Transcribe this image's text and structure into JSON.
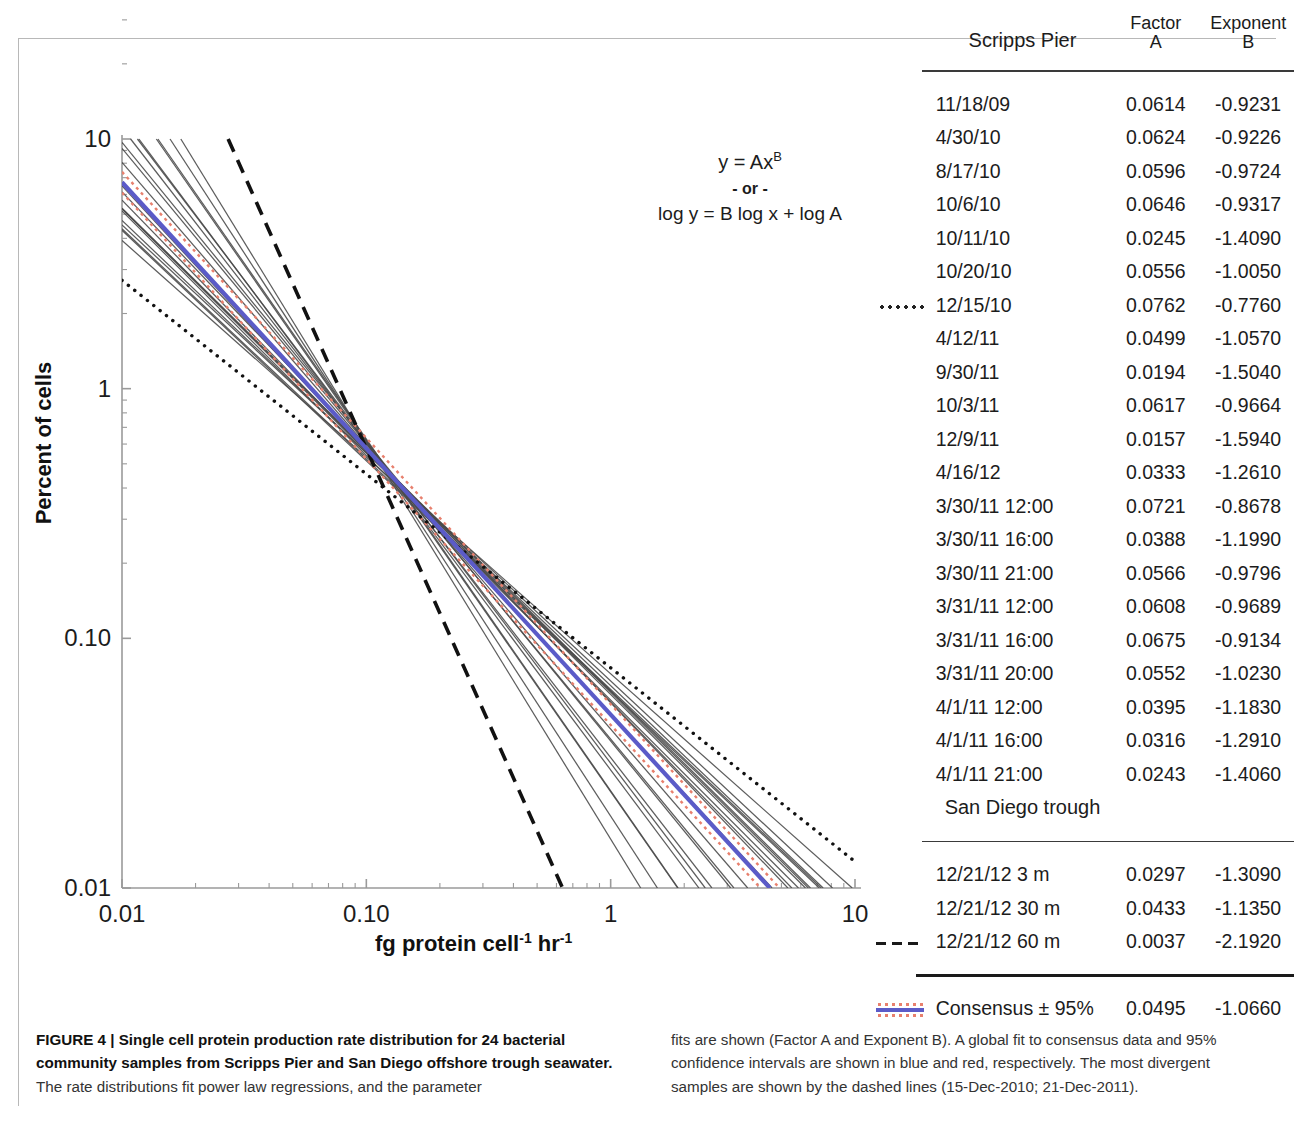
{
  "figure": {
    "equation": {
      "line1_prefix": "y = Ax",
      "line1_exponent": "B",
      "line2": "- or -",
      "line3": "log y = B log x + log A"
    },
    "axes": {
      "ylabel": "Percent of cells",
      "xlabel_prefix": "fg protein cell",
      "xlabel_sup1": "-1",
      "xlabel_mid": " hr",
      "xlabel_sup2": "-1",
      "x_ticks": [
        "0.01",
        "0.10",
        "1",
        "10"
      ],
      "y_ticks": [
        "10",
        "1",
        "0.10",
        "0.01"
      ]
    }
  },
  "table": {
    "headers": {
      "group": "Scripps Pier",
      "factor_line1": "Factor",
      "factor_line2": "A",
      "exponent_line1": "Exponent",
      "exponent_line2": "B"
    },
    "subheader": "San Diego trough",
    "scripps_rows": [
      {
        "name": "11/18/09",
        "a": "0.0614",
        "b": "-0.9231",
        "mark": ""
      },
      {
        "name": "4/30/10",
        "a": "0.0624",
        "b": "-0.9226",
        "mark": ""
      },
      {
        "name": "8/17/10",
        "a": "0.0596",
        "b": "-0.9724",
        "mark": ""
      },
      {
        "name": "10/6/10",
        "a": "0.0646",
        "b": "-0.9317",
        "mark": ""
      },
      {
        "name": "10/11/10",
        "a": "0.0245",
        "b": "-1.4090",
        "mark": ""
      },
      {
        "name": "10/20/10",
        "a": "0.0556",
        "b": "-1.0050",
        "mark": ""
      },
      {
        "name": "12/15/10",
        "a": "0.0762",
        "b": "-0.7760",
        "mark": "dotted-line"
      },
      {
        "name": "4/12/11",
        "a": "0.0499",
        "b": "-1.0570",
        "mark": ""
      },
      {
        "name": "9/30/11",
        "a": "0.0194",
        "b": "-1.5040",
        "mark": ""
      },
      {
        "name": "10/3/11",
        "a": "0.0617",
        "b": "-0.9664",
        "mark": ""
      },
      {
        "name": "12/9/11",
        "a": "0.0157",
        "b": "-1.5940",
        "mark": ""
      },
      {
        "name": "4/16/12",
        "a": "0.0333",
        "b": "-1.2610",
        "mark": ""
      },
      {
        "name": "3/30/11 12:00",
        "a": "0.0721",
        "b": "-0.8678",
        "mark": ""
      },
      {
        "name": "3/30/11 16:00",
        "a": "0.0388",
        "b": "-1.1990",
        "mark": ""
      },
      {
        "name": "3/30/11 21:00",
        "a": "0.0566",
        "b": "-0.9796",
        "mark": ""
      },
      {
        "name": "3/31/11 12:00",
        "a": "0.0608",
        "b": "-0.9689",
        "mark": ""
      },
      {
        "name": "3/31/11 16:00",
        "a": "0.0675",
        "b": "-0.9134",
        "mark": ""
      },
      {
        "name": "3/31/11 20:00",
        "a": "0.0552",
        "b": "-1.0230",
        "mark": ""
      },
      {
        "name": "4/1/11 12:00",
        "a": "0.0395",
        "b": "-1.1830",
        "mark": ""
      },
      {
        "name": "4/1/11 16:00",
        "a": "0.0316",
        "b": "-1.2910",
        "mark": ""
      },
      {
        "name": "4/1/11 21:00",
        "a": "0.0243",
        "b": "-1.4060",
        "mark": ""
      }
    ],
    "trough_rows": [
      {
        "name": "12/21/12 3 m",
        "a": "0.0297",
        "b": "-1.3090",
        "mark": ""
      },
      {
        "name": "12/21/12 30 m",
        "a": "0.0433",
        "b": "-1.1350",
        "mark": ""
      },
      {
        "name": "12/21/12 60 m",
        "a": "0.0037",
        "b": "-2.1920",
        "mark": "dashed-line"
      }
    ],
    "consensus_row": {
      "name": "Consensus ± 95%",
      "a": "0.0495",
      "b": "-1.0660",
      "mark": "consensus-line"
    }
  },
  "caption": {
    "left": "FIGURE 4 | Single cell protein production rate distribution for 24 bacterial community samples from Scripps Pier and San Diego offshore trough seawater.",
    "left_rest": " The rate distributions fit power law regressions, and the parameter",
    "right": "fits are shown (Factor A and Exponent B). A global fit to consensus data and 95% confidence intervals are shown in blue and red, respectively. The most divergent samples are shown by the dashed lines (15-Dec-2010; 21-Dec-2011)."
  },
  "colors": {
    "consensus_blue": "#5b5bc8",
    "ci_red": "#e8806e",
    "line_gray": "#4a4a4a",
    "axis": "#9a9a9a"
  },
  "chart_data": {
    "type": "line",
    "title": "",
    "xlabel": "fg protein cell-1 hr-1",
    "ylabel": "Percent of cells",
    "xlim": [
      0.01,
      10
    ],
    "ylim": [
      0.01,
      10
    ],
    "xscale": "log",
    "yscale": "log",
    "grid": false,
    "legend": "table-at-right",
    "model": "y = A*x^B",
    "series": [
      {
        "name": "11/18/09",
        "A": 0.0614,
        "B": -0.9231,
        "style": "solid-gray"
      },
      {
        "name": "4/30/10",
        "A": 0.0624,
        "B": -0.9226,
        "style": "solid-gray"
      },
      {
        "name": "8/17/10",
        "A": 0.0596,
        "B": -0.9724,
        "style": "solid-gray"
      },
      {
        "name": "10/6/10",
        "A": 0.0646,
        "B": -0.9317,
        "style": "solid-gray"
      },
      {
        "name": "10/11/10",
        "A": 0.0245,
        "B": -1.409,
        "style": "solid-gray"
      },
      {
        "name": "10/20/10",
        "A": 0.0556,
        "B": -1.005,
        "style": "solid-gray"
      },
      {
        "name": "12/15/10",
        "A": 0.0762,
        "B": -0.776,
        "style": "dotted-black"
      },
      {
        "name": "4/12/11",
        "A": 0.0499,
        "B": -1.057,
        "style": "solid-gray"
      },
      {
        "name": "9/30/11",
        "A": 0.0194,
        "B": -1.504,
        "style": "solid-gray"
      },
      {
        "name": "10/3/11",
        "A": 0.0617,
        "B": -0.9664,
        "style": "solid-gray"
      },
      {
        "name": "12/9/11",
        "A": 0.0157,
        "B": -1.594,
        "style": "solid-gray"
      },
      {
        "name": "4/16/12",
        "A": 0.0333,
        "B": -1.261,
        "style": "solid-gray"
      },
      {
        "name": "3/30/11 12:00",
        "A": 0.0721,
        "B": -0.8678,
        "style": "solid-gray"
      },
      {
        "name": "3/30/11 16:00",
        "A": 0.0388,
        "B": -1.199,
        "style": "solid-gray"
      },
      {
        "name": "3/30/11 21:00",
        "A": 0.0566,
        "B": -0.9796,
        "style": "solid-gray"
      },
      {
        "name": "3/31/11 12:00",
        "A": 0.0608,
        "B": -0.9689,
        "style": "solid-gray"
      },
      {
        "name": "3/31/11 16:00",
        "A": 0.0675,
        "B": -0.9134,
        "style": "solid-gray"
      },
      {
        "name": "3/31/11 20:00",
        "A": 0.0552,
        "B": -1.023,
        "style": "solid-gray"
      },
      {
        "name": "4/1/11 12:00",
        "A": 0.0395,
        "B": -1.183,
        "style": "solid-gray"
      },
      {
        "name": "4/1/11 16:00",
        "A": 0.0316,
        "B": -1.291,
        "style": "solid-gray"
      },
      {
        "name": "4/1/11 21:00",
        "A": 0.0243,
        "B": -1.406,
        "style": "solid-gray"
      },
      {
        "name": "12/21/12 3 m",
        "A": 0.0297,
        "B": -1.309,
        "style": "solid-gray"
      },
      {
        "name": "12/21/12 30 m",
        "A": 0.0433,
        "B": -1.135,
        "style": "solid-gray"
      },
      {
        "name": "12/21/12 60 m",
        "A": 0.0037,
        "B": -2.192,
        "style": "dashed-black"
      },
      {
        "name": "Consensus",
        "A": 0.0495,
        "B": -1.066,
        "style": "solid-blue"
      },
      {
        "name": "95% CI upper",
        "A": 0.0545,
        "B": -1.066,
        "style": "dotted-red"
      },
      {
        "name": "95% CI lower",
        "A": 0.045,
        "B": -1.066,
        "style": "dotted-red"
      }
    ]
  }
}
